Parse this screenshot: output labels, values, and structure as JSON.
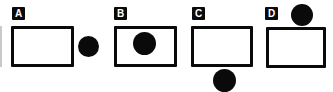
{
  "figure": {
    "background_color": "#ffffff",
    "shape_color": "#0a0a0a",
    "panels": [
      {
        "label": "A",
        "circle_position": "outside-right-of-rectangle"
      },
      {
        "label": "B",
        "circle_position": "inside-rectangle"
      },
      {
        "label": "C",
        "circle_position": "outside-below-rectangle"
      },
      {
        "label": "D",
        "circle_position": "outside-above-rectangle-touching-top-edge"
      }
    ]
  }
}
